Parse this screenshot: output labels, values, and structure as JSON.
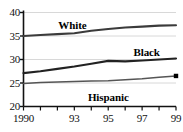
{
  "chart_data": {
    "type": "line",
    "title": "",
    "xlabel": "",
    "ylabel": "",
    "xlim": [
      1990,
      1999
    ],
    "ylim": [
      20,
      40
    ],
    "grid": true,
    "legend_position": "inline-labels",
    "x": [
      1990,
      1991,
      1992,
      1993,
      1994,
      1995,
      1996,
      1997,
      1998,
      1999
    ],
    "xtick_values": [
      1990,
      1991,
      1992,
      1993,
      1994,
      1995,
      1996,
      1997,
      1998,
      1999
    ],
    "xtick_labels_shown": [
      "1990",
      "93",
      "95",
      "97",
      "99"
    ],
    "xtick_labels_shown_at": [
      1990,
      1993,
      1995,
      1997,
      1999
    ],
    "ytick_values": [
      20,
      25,
      30,
      35,
      40
    ],
    "ytick_labels": [
      "20",
      "25",
      "30",
      "35",
      "40"
    ],
    "series": [
      {
        "name": "White",
        "color": "#3b3b3b",
        "values": [
          35.0,
          35.2,
          35.4,
          35.6,
          36.1,
          36.5,
          36.8,
          37.0,
          37.2,
          37.3
        ],
        "end_marker": false
      },
      {
        "name": "Black",
        "color": "#222222",
        "values": [
          27.1,
          27.5,
          28.0,
          28.5,
          29.1,
          29.7,
          29.6,
          29.8,
          30.0,
          30.2
        ],
        "end_marker": false
      },
      {
        "name": "Hispanic",
        "color": "#555555",
        "values": [
          24.9,
          25.1,
          25.2,
          25.3,
          25.4,
          25.5,
          25.7,
          25.9,
          26.2,
          26.5
        ],
        "end_marker": true
      }
    ],
    "annotations": [
      {
        "text": "White",
        "series": "White"
      },
      {
        "text": "Black",
        "series": "Black"
      },
      {
        "text": "Hispanic",
        "series": "Hispanic"
      }
    ]
  },
  "axis": {
    "y_labels": [
      "40",
      "35",
      "30",
      "25",
      "20"
    ],
    "x_labels": [
      "1990",
      "93",
      "95",
      "97",
      "99"
    ]
  },
  "style": {
    "grid_color": "#d8d8d8",
    "axis_color": "#111111",
    "background": "#ffffff"
  }
}
